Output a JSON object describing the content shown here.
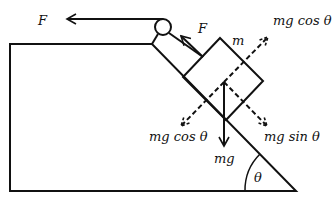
{
  "diagram": {
    "labels": {
      "rope_force": "F",
      "tension_on_block": "F",
      "mass": "m",
      "normal_component_up": "mg cos θ",
      "normal_component_down": "mg cos θ",
      "parallel_component": "mg sin θ",
      "weight": "mg",
      "angle": "θ"
    },
    "colors": {
      "stroke": "#111111",
      "background": "#ffffff"
    }
  }
}
